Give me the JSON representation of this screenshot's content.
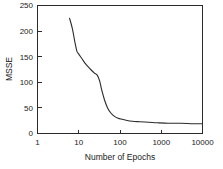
{
  "chart_data": {
    "type": "line",
    "title": "",
    "xlabel": "Number of Epochs",
    "ylabel": "MSSE",
    "xscale": "log",
    "yscale": "linear",
    "xlim": [
      1,
      10000
    ],
    "ylim": [
      0,
      250
    ],
    "grid": false,
    "legend": false,
    "x_ticks": [
      1,
      10,
      100,
      1000,
      10000
    ],
    "x_tick_labels": [
      "1",
      "10",
      "100",
      "1000",
      "10000"
    ],
    "y_ticks": [
      0,
      50,
      100,
      150,
      200,
      250
    ],
    "y_tick_labels": [
      "0",
      "50",
      "100",
      "150",
      "200",
      "250"
    ],
    "series": [
      {
        "name": "MSSE",
        "color": "#2b2b2b",
        "x": [
          6,
          7,
          8,
          9,
          10,
          12,
          14,
          17,
          20,
          24,
          28,
          32,
          36,
          42,
          50,
          60,
          75,
          90,
          110,
          140,
          200,
          300,
          500,
          800,
          1500,
          3000,
          6000,
          10000
        ],
        "y": [
          225,
          205,
          180,
          161,
          155,
          146,
          138,
          130,
          124,
          118,
          114,
          103,
          85,
          66,
          50,
          40,
          33,
          30,
          28,
          26,
          24,
          23,
          22,
          21,
          20,
          20,
          19,
          19
        ]
      }
    ]
  },
  "axis": {
    "x_title": "Number of Epochs",
    "y_title": "MSSE"
  }
}
